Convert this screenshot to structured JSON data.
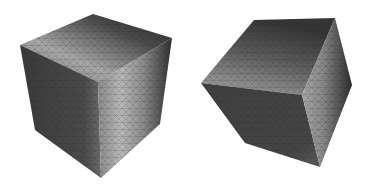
{
  "figure": {
    "background": "#ffffff",
    "panels": [
      {
        "name": "left-cube",
        "description": "Shaded tetrahedral-meshed cube, front corner view",
        "faces": {
          "top": {
            "points": "20,45 93,14 172,38 98,82"
          },
          "left": {
            "points": "20,45 98,82 101,178 35,130"
          },
          "right": {
            "points": "98,82 172,38 160,124 101,178"
          }
        }
      },
      {
        "name": "right-cube",
        "description": "Shaded tetrahedral-meshed cube, rotated view",
        "faces": {
          "top": {
            "points": "201,83 254,20 335,18 302,95"
          },
          "left": {
            "points": "201,83 302,95 320,167 245,143"
          },
          "right": {
            "points": "302,95 335,18 352,85 320,167"
          }
        }
      }
    ]
  }
}
